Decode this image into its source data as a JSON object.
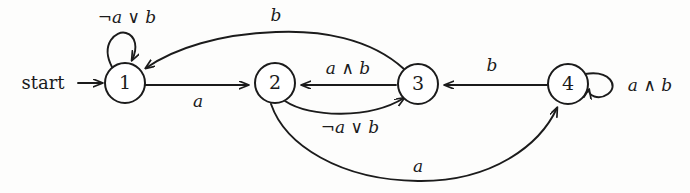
{
  "diagram": {
    "type": "state-machine",
    "background_color": "#fdfdfc",
    "ink_color": "#1b1b1b",
    "start_label": "start",
    "states": [
      {
        "id": "s1",
        "label": "1",
        "cx": 125,
        "cy": 83,
        "r": 20
      },
      {
        "id": "s2",
        "label": "2",
        "cx": 275,
        "cy": 83,
        "r": 20
      },
      {
        "id": "s3",
        "label": "3",
        "cx": 418,
        "cy": 84,
        "r": 20
      },
      {
        "id": "s4",
        "label": "4",
        "cx": 568,
        "cy": 84,
        "r": 20
      }
    ],
    "transitions": [
      {
        "id": "t_start",
        "from": "start",
        "to": "1",
        "label": ""
      },
      {
        "id": "t_1_1",
        "from": "1",
        "to": "1",
        "label": "¬a ∨ b",
        "label_x": 127,
        "label_y": 18
      },
      {
        "id": "t_1_2",
        "from": "1",
        "to": "2",
        "label": "a",
        "label_x": 198,
        "label_y": 102
      },
      {
        "id": "t_3_1",
        "from": "3",
        "to": "1",
        "label": "b",
        "label_x": 276,
        "label_y": 16
      },
      {
        "id": "t_3_2",
        "from": "3",
        "to": "2",
        "label": "a ∧ b",
        "label_x": 348,
        "label_y": 69
      },
      {
        "id": "t_2_3",
        "from": "2",
        "to": "3",
        "label": "¬a ∨ b",
        "label_x": 350,
        "label_y": 128
      },
      {
        "id": "t_4_3",
        "from": "4",
        "to": "3",
        "label": "b",
        "label_x": 492,
        "label_y": 66
      },
      {
        "id": "t_4_4",
        "from": "4",
        "to": "4",
        "label": "a ∧ b",
        "label_x": 650,
        "label_y": 86
      },
      {
        "id": "t_2_4",
        "from": "2",
        "to": "4",
        "label": "a",
        "label_x": 418,
        "label_y": 167
      }
    ]
  }
}
